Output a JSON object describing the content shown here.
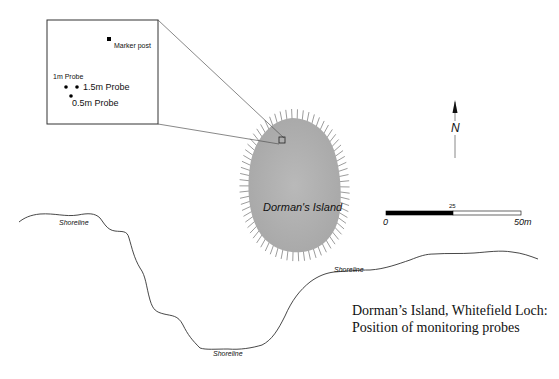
{
  "map": {
    "island": {
      "name": "Dorman's Island",
      "fill_color": "#b4b4b4",
      "spike_color": "#9a9a9a"
    },
    "inset": {
      "marker": {
        "label": "Marker post"
      },
      "probes": [
        {
          "label": "1m Probe"
        },
        {
          "label": "1.5m Probe"
        },
        {
          "label": "0.5m Probe"
        }
      ]
    },
    "shoreline_labels": [
      "Shoreline",
      "Shoreline",
      "Shoreline"
    ],
    "north_arrow": {
      "label": "N"
    },
    "scale_bar": {
      "start_label": "0",
      "mid_label": "25",
      "end_label": "50m"
    },
    "caption": {
      "line1": "Dorman’s Island, Whitefield Loch:",
      "line2": "Position of monitoring probes"
    }
  }
}
